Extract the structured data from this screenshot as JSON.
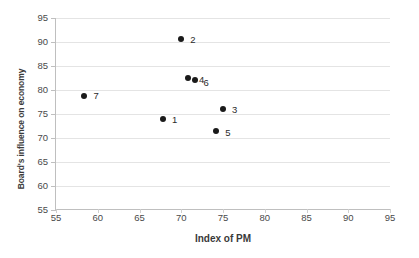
{
  "chart_data": {
    "type": "scatter",
    "title": "",
    "xlabel": "Index of PM",
    "ylabel": "Board's influence on economy",
    "xlim": [
      55,
      95
    ],
    "ylim": [
      55,
      95
    ],
    "xticks": [
      55,
      60,
      65,
      70,
      75,
      80,
      85,
      90,
      95
    ],
    "yticks": [
      55,
      60,
      65,
      70,
      75,
      80,
      85,
      90,
      95
    ],
    "grid": "horizontal",
    "legend": "none",
    "marker_color": "#1a1a1a",
    "points": [
      {
        "label": "1",
        "x": 67.8,
        "y": 74.0,
        "label_dx": 9,
        "label_dy": 1
      },
      {
        "label": "2",
        "x": 70.0,
        "y": 90.7,
        "label_dx": 9,
        "label_dy": 1
      },
      {
        "label": "3",
        "x": 75.0,
        "y": 76.1,
        "label_dx": 9,
        "label_dy": 1
      },
      {
        "label": "4",
        "x": 70.8,
        "y": 82.6,
        "label_dx": 11,
        "label_dy": 2
      },
      {
        "label": "5",
        "x": 74.2,
        "y": 71.4,
        "label_dx": 9,
        "label_dy": 2
      },
      {
        "label": "6",
        "x": 71.7,
        "y": 82.1,
        "label_dx": 8,
        "label_dy": 3
      },
      {
        "label": "7",
        "x": 58.4,
        "y": 78.8,
        "label_dx": 9,
        "label_dy": 0
      }
    ]
  },
  "axes": {
    "x_title": "Index of PM",
    "y_title": "Board's influence on economy",
    "x_tick_labels": [
      "55",
      "60",
      "65",
      "70",
      "75",
      "80",
      "85",
      "90",
      "95"
    ],
    "y_tick_labels": [
      "55",
      "60",
      "65",
      "70",
      "75",
      "80",
      "85",
      "90",
      "95"
    ]
  }
}
